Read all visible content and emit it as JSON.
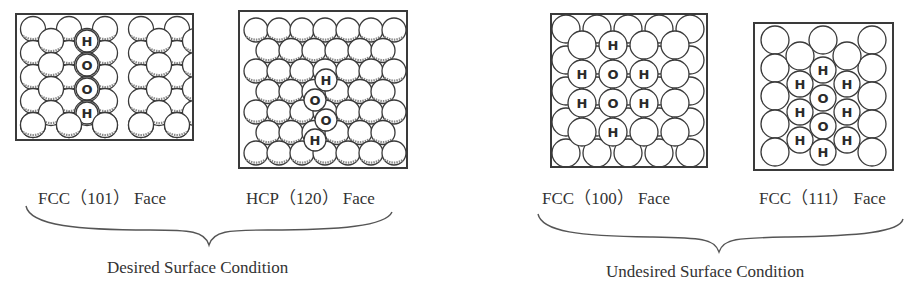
{
  "figure": {
    "panels": [
      {
        "id": "fcc-101",
        "label": "FCC（101） Face",
        "lattice": "rect-staggered",
        "adsorbate": [
          "H",
          "O",
          "O",
          "H"
        ],
        "adsorbate_arrangement": "vertical chain H-O-O-H"
      },
      {
        "id": "hcp-120",
        "label": "HCP（120） Face",
        "lattice": "hex-close-packed",
        "adsorbate": [
          "H",
          "O",
          "O",
          "H"
        ],
        "adsorbate_arrangement": "zigzag chain H-O-O-H"
      },
      {
        "id": "fcc-100",
        "label": "FCC（100） Face",
        "lattice": "square",
        "adsorbate": [
          "H",
          "H",
          "O",
          "H",
          "H",
          "O",
          "H",
          "H"
        ],
        "adsorbate_arrangement": "two O atoms each surrounded by H"
      },
      {
        "id": "fcc-111",
        "label": "FCC（111） Face",
        "lattice": "hexagonal",
        "adsorbate": [
          "H",
          "H",
          "H",
          "O",
          "H",
          "H",
          "O",
          "H",
          "H",
          "H"
        ],
        "adsorbate_arrangement": "two O atoms with six-fold H coordination"
      }
    ],
    "groups": [
      {
        "id": "desired",
        "label": "Desired Surface Condition",
        "panels": [
          "fcc-101",
          "hcp-120"
        ]
      },
      {
        "id": "undesired",
        "label": "Undesired Surface Condition",
        "panels": [
          "fcc-100",
          "fcc-111"
        ]
      }
    ],
    "colors": {
      "line": "#3a3a3a",
      "atom_fill": "#ffffff",
      "shade": "#8a8a8a",
      "text": "#2e2e2e"
    }
  }
}
